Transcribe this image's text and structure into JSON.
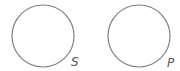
{
  "diagram": {
    "width": 180,
    "height": 71,
    "background": "#ffffff",
    "stroke_color": "#808080",
    "label_color": "#555555",
    "circles": [
      {
        "id": "S",
        "label": "S",
        "cx": 43,
        "cy": 36,
        "r": 31,
        "label_x": 71,
        "label_y": 66
      },
      {
        "id": "P",
        "label": "P",
        "cx": 139,
        "cy": 36,
        "r": 31,
        "label_x": 167,
        "label_y": 67
      }
    ]
  }
}
